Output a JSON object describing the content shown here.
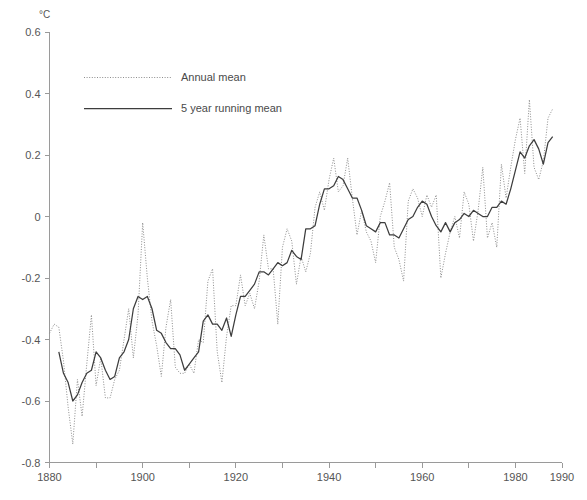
{
  "chart_data": {
    "type": "line",
    "title": "",
    "subtitle": "",
    "xlabel": "",
    "ylabel": "°C",
    "ylabel_position": "top-left-above-axis",
    "xlim": [
      1880,
      1990
    ],
    "ylim": [
      -0.8,
      0.6
    ],
    "grid": false,
    "legend_position": "top-left-inside",
    "x_major_ticks": [
      1880,
      1900,
      1920,
      1940,
      1960,
      1980,
      1990
    ],
    "x_minor_ticks": [
      1890,
      1910,
      1930,
      1950,
      1970
    ],
    "x_tick_labels": [
      "1880",
      "1900",
      "1920",
      "1940",
      "1960",
      "1980",
      "1990"
    ],
    "y_ticks": [
      0.6,
      0.4,
      0.2,
      0,
      -0.2,
      -0.4,
      -0.6,
      -0.8
    ],
    "y_tick_labels": [
      "0.6",
      "0.4",
      "0.2",
      "0",
      "-0.2",
      "-0.4",
      "-0.6",
      "-0.8"
    ],
    "x": [
      1880,
      1881,
      1882,
      1883,
      1884,
      1885,
      1886,
      1887,
      1888,
      1889,
      1890,
      1891,
      1892,
      1893,
      1894,
      1895,
      1896,
      1897,
      1898,
      1899,
      1900,
      1901,
      1902,
      1903,
      1904,
      1905,
      1906,
      1907,
      1908,
      1909,
      1910,
      1911,
      1912,
      1913,
      1914,
      1915,
      1916,
      1917,
      1918,
      1919,
      1920,
      1921,
      1922,
      1923,
      1924,
      1925,
      1926,
      1927,
      1928,
      1929,
      1930,
      1931,
      1932,
      1933,
      1934,
      1935,
      1936,
      1937,
      1938,
      1939,
      1940,
      1941,
      1942,
      1943,
      1944,
      1945,
      1946,
      1947,
      1948,
      1949,
      1950,
      1951,
      1952,
      1953,
      1954,
      1955,
      1956,
      1957,
      1958,
      1959,
      1960,
      1961,
      1962,
      1963,
      1964,
      1965,
      1966,
      1967,
      1968,
      1969,
      1970,
      1971,
      1972,
      1973,
      1974,
      1975,
      1976,
      1977,
      1978,
      1979,
      1980,
      1981,
      1982,
      1983,
      1984,
      1985,
      1986,
      1987,
      1988
    ],
    "series": [
      {
        "name": "Annual mean",
        "style": "dotted",
        "color": "#8d8d8d",
        "values": [
          -0.38,
          -0.35,
          -0.36,
          -0.47,
          -0.62,
          -0.74,
          -0.53,
          -0.65,
          -0.48,
          -0.32,
          -0.55,
          -0.46,
          -0.59,
          -0.59,
          -0.53,
          -0.5,
          -0.4,
          -0.3,
          -0.46,
          -0.32,
          -0.02,
          -0.2,
          -0.34,
          -0.42,
          -0.52,
          -0.36,
          -0.27,
          -0.49,
          -0.51,
          -0.51,
          -0.48,
          -0.51,
          -0.4,
          -0.41,
          -0.21,
          -0.17,
          -0.44,
          -0.54,
          -0.39,
          -0.29,
          -0.29,
          -0.19,
          -0.29,
          -0.25,
          -0.3,
          -0.21,
          -0.06,
          -0.17,
          -0.17,
          -0.35,
          -0.1,
          -0.04,
          -0.08,
          -0.22,
          -0.13,
          -0.18,
          -0.12,
          0.03,
          0.08,
          0.02,
          0.12,
          0.19,
          0.08,
          0.1,
          0.19,
          0.06,
          -0.06,
          0.02,
          -0.05,
          -0.08,
          -0.15,
          0.0,
          0.05,
          0.11,
          -0.1,
          -0.14,
          -0.21,
          0.05,
          0.09,
          0.06,
          0.0,
          0.07,
          0.03,
          0.07,
          -0.2,
          -0.12,
          -0.05,
          0.0,
          -0.07,
          0.08,
          0.04,
          -0.08,
          0.02,
          0.16,
          -0.07,
          -0.02,
          -0.1,
          0.17,
          0.06,
          0.16,
          0.25,
          0.32,
          0.14,
          0.38,
          0.16,
          0.12,
          0.18,
          0.32,
          0.35
        ]
      },
      {
        "name": "5 year running mean",
        "style": "solid",
        "color": "#3d3d3d",
        "values": [
          null,
          null,
          -0.44,
          -0.51,
          -0.54,
          -0.6,
          -0.58,
          -0.54,
          -0.51,
          -0.5,
          -0.44,
          -0.46,
          -0.5,
          -0.53,
          -0.52,
          -0.46,
          -0.44,
          -0.4,
          -0.3,
          -0.26,
          -0.27,
          -0.26,
          -0.3,
          -0.37,
          -0.38,
          -0.41,
          -0.43,
          -0.43,
          -0.45,
          -0.5,
          -0.48,
          -0.46,
          -0.44,
          -0.34,
          -0.32,
          -0.35,
          -0.35,
          -0.37,
          -0.33,
          -0.39,
          -0.32,
          -0.26,
          -0.26,
          -0.24,
          -0.22,
          -0.18,
          -0.18,
          -0.19,
          -0.17,
          -0.15,
          -0.16,
          -0.15,
          -0.11,
          -0.13,
          -0.14,
          -0.04,
          -0.04,
          -0.03,
          0.04,
          0.09,
          0.09,
          0.1,
          0.13,
          0.12,
          0.09,
          0.06,
          0.06,
          0.02,
          -0.03,
          -0.04,
          -0.05,
          -0.02,
          -0.02,
          -0.06,
          -0.06,
          -0.07,
          -0.04,
          -0.01,
          0.0,
          0.03,
          0.05,
          0.04,
          0.0,
          -0.03,
          -0.05,
          -0.02,
          -0.05,
          -0.02,
          -0.01,
          0.01,
          0.0,
          0.02,
          0.01,
          0.0,
          0.0,
          0.03,
          0.03,
          0.05,
          0.04,
          0.09,
          0.15,
          0.21,
          0.19,
          0.23,
          0.25,
          0.22,
          0.17,
          0.24,
          0.26
        ]
      }
    ]
  },
  "legend": {
    "entries": [
      {
        "label": "Annual mean"
      },
      {
        "label": "5 year running mean"
      }
    ]
  },
  "axes": {
    "y_unit": "°C"
  }
}
